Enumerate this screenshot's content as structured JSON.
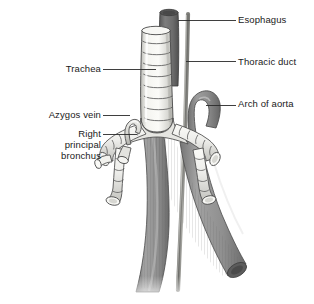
{
  "figure": {
    "background_color": "#ffffff",
    "line_color": "#3a3a3a",
    "text_color": "#1a1a1a"
  },
  "labels": {
    "esophagus": "Esophagus",
    "thoracic_duct": "Thoracic duct",
    "arch_of_aorta": "Arch of aorta",
    "trachea": "Trachea",
    "azygos_vein": "Azygos vein",
    "right_principal_bronchus": "Right\nprincipal\nbronchus"
  },
  "structures": [
    {
      "name": "trachea",
      "label": "Trachea",
      "description": "Pale ringed cartilaginous tube descending in the midline",
      "fill_color": "#f2f2ee",
      "outline_color": "#4a4a4a",
      "ring_count": 8
    },
    {
      "name": "esophagus",
      "label": "Esophagus",
      "description": "Dark grey tube behind the trachea descending to the right",
      "fill_color": "#6e6e6e",
      "outline_color": "#3a3a3a"
    },
    {
      "name": "thoracic-duct",
      "label": "Thoracic duct",
      "description": "Thin narrow tube running the full height at the right of the trachea",
      "fill_color": "#9a9a96",
      "outline_color": "#555555"
    },
    {
      "name": "arch-of-aorta",
      "label": "Arch of aorta",
      "description": "Hook shaped vessel arching over the left principal bronchus",
      "fill_color": "#8d8d8d",
      "outline_color": "#4a4a4a"
    },
    {
      "name": "azygos-vein",
      "label": "Azygos vein",
      "description": "Small hooked vein arching over the right principal bronchus",
      "fill_color": "#c9c9c5",
      "outline_color": "#4a4a4a"
    },
    {
      "name": "right-principal-bronchus",
      "label": "Right principal bronchus",
      "description": "Ringed airway branching to the viewer's left with lobar branches",
      "fill_color": "#ededea",
      "outline_color": "#4a4a4a"
    },
    {
      "name": "left-principal-bronchus",
      "label": "",
      "description": "Ringed airway branching to the viewer's right",
      "fill_color": "#ededea",
      "outline_color": "#4a4a4a"
    },
    {
      "name": "descending-aorta",
      "label": "",
      "description": "Large striated vessel descending obliquely to the lower right",
      "fill_color": "#8a8a8a",
      "outline_color": "#4a4a4a"
    }
  ],
  "leaders": [
    {
      "name": "esophagus-leader",
      "from": [
        178,
        20
      ],
      "to": [
        236,
        20
      ]
    },
    {
      "name": "thoracic-duct-leader",
      "from": [
        186,
        61
      ],
      "to": [
        236,
        61
      ]
    },
    {
      "name": "aorta-leader",
      "from": [
        205,
        105
      ],
      "to": [
        236,
        105
      ]
    },
    {
      "name": "trachea-leader",
      "from": [
        103,
        69
      ],
      "to": [
        156,
        69
      ]
    },
    {
      "name": "azygos-leader",
      "from": [
        103,
        115
      ],
      "to": [
        128,
        115
      ]
    },
    {
      "name": "bronchus-leader",
      "from": [
        103,
        134
      ],
      "to": [
        136,
        134
      ]
    }
  ]
}
